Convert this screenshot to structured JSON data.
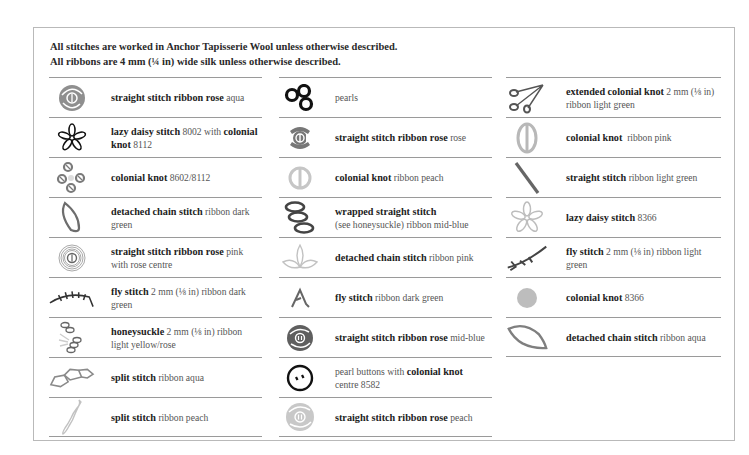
{
  "notes": {
    "line1": "All stitches are worked in Anchor Tapisserie Wool unless otherwise described.",
    "line2": "All ribbons are 4 mm (¼ in) wide silk unless otherwise described."
  },
  "colors": {
    "aqua": "#9b9b9b",
    "dark": "#111111",
    "mid_grey": "#6f6f6f",
    "light_grey": "#c4c4c4",
    "rule": "#9a9a9a",
    "frame": "#b9b9b9"
  },
  "columns": [
    {
      "items": [
        {
          "icon": "ribbon-rose-aqua-icon",
          "bold": "straight stitch ribbon rose",
          "rest": " aqua"
        },
        {
          "icon": "lazy-daisy-black-icon",
          "bold": "lazy daisy stitch",
          "rest": " 8002 with ",
          "bold2": "colonial knot",
          "rest2": " 8112"
        },
        {
          "icon": "colonial-knot-cluster-icon",
          "bold": "colonial knot",
          "rest": " 8602/8112"
        },
        {
          "icon": "detached-chain-leaf-icon",
          "bold": "detached chain stitch",
          "rest": " ribbon dark green"
        },
        {
          "icon": "ribbon-rose-pink-icon",
          "bold": "straight stitch ribbon rose",
          "rest": " pink with rose centre"
        },
        {
          "icon": "fly-stitch-stem-icon",
          "bold": "fly stitch",
          "rest": " 2 mm (⅛ in) ribbon dark green"
        },
        {
          "icon": "honeysuckle-icon",
          "bold": "honeysuckle",
          "rest": " 2 mm (⅛ in) ribbon light yellow/rose"
        },
        {
          "icon": "split-stitch-aqua-icon",
          "bold": "split stitch",
          "rest": " ribbon aqua"
        },
        {
          "icon": "split-stitch-peach-icon",
          "bold": "split stitch",
          "rest": " ribbon peach"
        }
      ]
    },
    {
      "items": [
        {
          "icon": "pearls-icon",
          "bold": "",
          "rest": "pearls"
        },
        {
          "icon": "ribbon-rose-rose-icon",
          "bold": "straight stitch ribbon rose",
          "rest": " rose"
        },
        {
          "icon": "colonial-knot-peach-icon",
          "bold": "colonial knot",
          "rest": " ribbon peach"
        },
        {
          "icon": "wrapped-straight-stitch-icon",
          "bold": "wrapped straight stitch",
          "rest": "(see honeysuckle) ribbon mid-blue"
        },
        {
          "icon": "detached-chain-pink-icon",
          "bold": "detached chain stitch",
          "rest": " ribbon pink"
        },
        {
          "icon": "fly-stitch-dark-green-icon",
          "bold": "fly stitch",
          "rest": " ribbon dark green"
        },
        {
          "icon": "ribbon-rose-mid-blue-icon",
          "bold": "straight stitch ribbon rose",
          "rest": " mid-blue"
        },
        {
          "icon": "pearl-button-icon",
          "pre": "pearl buttons with ",
          "bold": "colonial knot",
          "rest": " centre 8582"
        },
        {
          "icon": "ribbon-rose-peach-icon",
          "bold": "straight stitch ribbon rose",
          "rest": " peach"
        }
      ]
    },
    {
      "items": [
        {
          "icon": "extended-colonial-knot-icon",
          "bold": "extended colonial knot",
          "rest": " 2 mm (⅛ in) ribbon light green"
        },
        {
          "icon": "colonial-knot-pink-icon",
          "bold": "colonial knot",
          "rest": "  ribbon pink"
        },
        {
          "icon": "straight-stitch-icon",
          "bold": "straight stitch",
          "rest": " ribbon light green"
        },
        {
          "icon": "lazy-daisy-8366-icon",
          "bold": "lazy daisy stitch",
          "rest": " 8366"
        },
        {
          "icon": "fly-stitch-light-green-icon",
          "bold": "fly stitch",
          "rest": " 2 mm (⅛ in) ribbon light green"
        },
        {
          "icon": "colonial-knot-8366-icon",
          "bold": "colonial knot",
          "rest": " 8366"
        },
        {
          "icon": "detached-chain-aqua-icon",
          "bold": "detached chain stitch",
          "rest": " ribbon aqua"
        }
      ]
    }
  ]
}
